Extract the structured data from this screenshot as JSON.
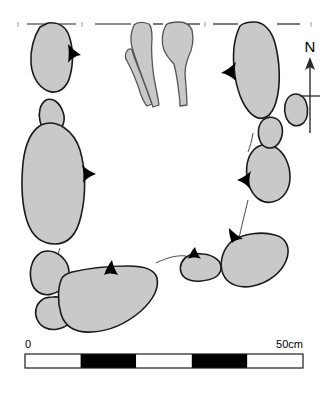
{
  "figure": {
    "type": "archaeological-plan-drawing",
    "background_color": "#ffffff",
    "stone_fill_color": "#c9c9c9",
    "stone_outline_color": "#1a1a1a",
    "bone_fill_color": "#c9c9c9",
    "bone_outline_color": "#555555",
    "wedge_color": "#000000"
  },
  "north_arrow": {
    "label": "N",
    "icon": "north-arrow-icon",
    "direction": "up"
  },
  "scale_bar": {
    "start_label": "0",
    "end_label": "50cm",
    "total_cm": 50,
    "segment_count": 5,
    "segment_cm": 10,
    "segment_colors": [
      "#ffffff",
      "#000000",
      "#ffffff",
      "#000000",
      "#ffffff"
    ]
  },
  "section_line": {
    "name": "section-edge-line",
    "style": "broken-horizontal"
  },
  "stones": [
    {
      "id": "stone-nw-upper",
      "label": "stone"
    },
    {
      "id": "stone-nw-small",
      "label": "stone"
    },
    {
      "id": "stone-w-large",
      "label": "stone"
    },
    {
      "id": "stone-w-mid",
      "label": "stone"
    },
    {
      "id": "stone-w-lower",
      "label": "stone"
    },
    {
      "id": "stone-s-large",
      "label": "stone"
    },
    {
      "id": "stone-s-small",
      "label": "stone"
    },
    {
      "id": "stone-se",
      "label": "stone"
    },
    {
      "id": "stone-e-mid",
      "label": "stone"
    },
    {
      "id": "stone-e-small",
      "label": "stone"
    },
    {
      "id": "stone-ne-upper",
      "label": "stone"
    },
    {
      "id": "stone-e-tiny",
      "label": "stone"
    }
  ],
  "bones": [
    {
      "id": "bone-left-thin",
      "label": "bone"
    },
    {
      "id": "bone-left-main",
      "label": "bone"
    },
    {
      "id": "bone-right-main",
      "label": "bone"
    }
  ],
  "wedges": [
    {
      "id": "wedge-nw",
      "label": "packing wedge"
    },
    {
      "id": "wedge-w",
      "label": "packing wedge"
    },
    {
      "id": "wedge-sw",
      "label": "packing wedge"
    },
    {
      "id": "wedge-s",
      "label": "packing wedge"
    },
    {
      "id": "wedge-se",
      "label": "packing wedge"
    },
    {
      "id": "wedge-e",
      "label": "packing wedge"
    },
    {
      "id": "wedge-ne",
      "label": "packing wedge"
    }
  ]
}
